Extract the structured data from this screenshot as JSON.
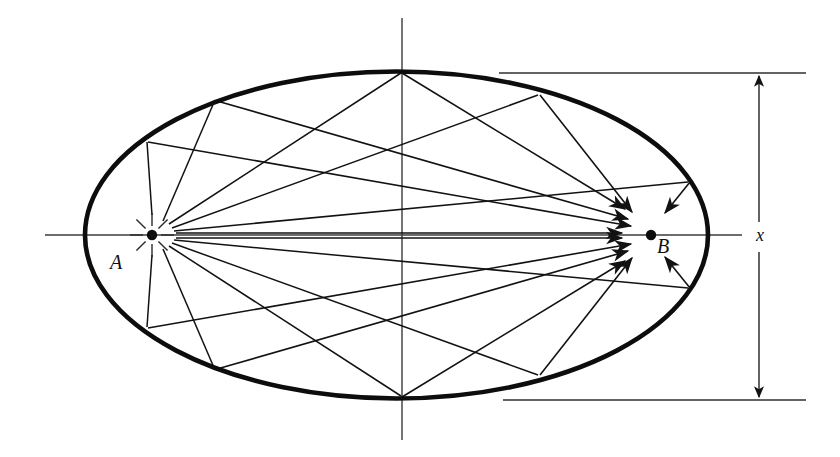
{
  "figure": {
    "type": "geometric-diagram",
    "background_color": "#ffffff",
    "ink_color": "#121212"
  },
  "labels": {
    "focus_a": "A",
    "focus_b": "B",
    "dimension": "x"
  },
  "geometry": {
    "ellipse": {
      "cx": 396.5,
      "cy": 235,
      "rx": 311.5,
      "ry": 163.5,
      "stroke_width": 4.5
    },
    "focus_a": {
      "x": 152,
      "y": 235,
      "r": 5
    },
    "focus_b": {
      "x": 651,
      "y": 235,
      "r": 5
    },
    "major_axis": {
      "x1": 45,
      "y1": 235,
      "x2": 742,
      "y2": 235
    },
    "minor_axis": {
      "x1": 402,
      "y1": 18,
      "x2": 402,
      "y2": 440
    },
    "dimension_line": {
      "x": 759,
      "y_top": 73,
      "y_bottom": 400
    },
    "extension_line_top": {
      "x1": 499,
      "y": 73,
      "x2": 806
    },
    "extension_line_bottom": {
      "x1": 503,
      "y": 400,
      "x2": 806
    },
    "sparkle_a": {
      "count": 8,
      "inner_r": 9,
      "outer_r": 22
    },
    "reflection_points": [
      {
        "id": "p-top-vertex",
        "x": 402,
        "y": 71
      },
      {
        "id": "p-upper-left-far",
        "x": 147,
        "y": 140
      },
      {
        "id": "p-upper-left",
        "x": 216,
        "y": 98
      },
      {
        "id": "p-upper-right",
        "x": 540,
        "y": 93
      },
      {
        "id": "p-right-upper",
        "x": 690,
        "y": 180
      },
      {
        "id": "p-bottom-vertex",
        "x": 402,
        "y": 398
      },
      {
        "id": "p-lower-left-far",
        "x": 147,
        "y": 329
      },
      {
        "id": "p-lower-left",
        "x": 216,
        "y": 372
      },
      {
        "id": "p-lower-right",
        "x": 540,
        "y": 377
      },
      {
        "id": "p-right-lower",
        "x": 690,
        "y": 290
      }
    ],
    "incident_rays": [
      {
        "from": "A",
        "to": "p-upper-left-far"
      },
      {
        "from": "A",
        "to": "p-upper-left"
      },
      {
        "from": "A",
        "to": "p-top-vertex"
      },
      {
        "from": "A",
        "to": "p-upper-right"
      },
      {
        "from": "A",
        "to": "p-right-upper"
      },
      {
        "from": "A",
        "to": "p-lower-left-far"
      },
      {
        "from": "A",
        "to": "p-lower-left"
      },
      {
        "from": "A",
        "to": "p-bottom-vertex"
      },
      {
        "from": "A",
        "to": "p-lower-right"
      },
      {
        "from": "A",
        "to": "p-right-lower"
      }
    ],
    "reflected_rays": [
      {
        "from": "p-upper-left-far",
        "to": "B",
        "arrow": true
      },
      {
        "from": "p-upper-left",
        "to": "B",
        "arrow": true
      },
      {
        "from": "p-top-vertex",
        "to": "B",
        "arrow": true
      },
      {
        "from": "p-upper-right",
        "to": "B",
        "arrow": true
      },
      {
        "from": "p-right-upper",
        "to": "B",
        "arrow": true
      },
      {
        "from": "p-lower-left-far",
        "to": "B",
        "arrow": true
      },
      {
        "from": "p-lower-left",
        "to": "B",
        "arrow": true
      },
      {
        "from": "p-bottom-vertex",
        "to": "B",
        "arrow": true
      },
      {
        "from": "p-lower-right",
        "to": "B",
        "arrow": true
      },
      {
        "from": "p-right-lower",
        "to": "B",
        "arrow": true
      }
    ]
  }
}
